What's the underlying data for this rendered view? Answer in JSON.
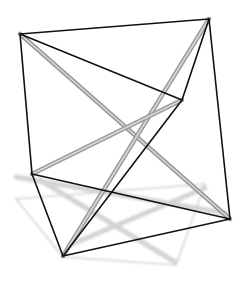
{
  "figure": {
    "colors": {
      "background": "#ffffff",
      "cable": "#111111",
      "strut": "#9a9a9a",
      "strut_highlight": "#d8d8d8",
      "shadow": "#d4d4d4"
    },
    "vertices": {
      "A": [
        20,
        34
      ],
      "B": [
        209,
        19
      ],
      "C": [
        182,
        100
      ],
      "D": [
        32,
        174
      ],
      "E": [
        230,
        219
      ],
      "F": [
        63,
        256
      ]
    },
    "cables": [
      [
        "A",
        "B"
      ],
      [
        "A",
        "C"
      ],
      [
        "A",
        "D"
      ],
      [
        "B",
        "C"
      ],
      [
        "B",
        "E"
      ],
      [
        "D",
        "E"
      ],
      [
        "D",
        "F"
      ],
      [
        "E",
        "F"
      ],
      [
        "C",
        "F"
      ]
    ],
    "struts": [
      [
        "A",
        "E"
      ],
      [
        "B",
        "F"
      ],
      [
        "C",
        "D"
      ]
    ],
    "shadow_outline": [
      [
        16,
        199
      ],
      [
        205,
        184
      ],
      [
        176,
        265
      ],
      [
        63,
        257
      ],
      [
        16,
        199
      ]
    ],
    "shadow_struts": [
      [
        [
          16,
          177
        ],
        [
          225,
          213
        ]
      ],
      [
        [
          40,
          180
        ],
        [
          175,
          262
        ]
      ],
      [
        [
          70,
          245
        ],
        [
          205,
          188
        ]
      ]
    ]
  }
}
